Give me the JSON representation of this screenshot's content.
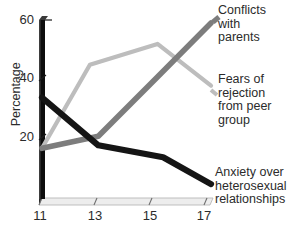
{
  "chart_data": {
    "type": "line",
    "title": "",
    "xlabel": "",
    "ylabel": "Percentage",
    "xlim": [
      11,
      17
    ],
    "ylim": [
      0,
      60
    ],
    "grid": false,
    "legend_position": "right-inline-annotations",
    "x_tick_labels": [
      "11",
      "13",
      "15",
      "17"
    ],
    "x_ticks": [
      11,
      13,
      15,
      17
    ],
    "y_tick_labels": [
      "20",
      "40",
      "60"
    ],
    "y_ticks": [
      20,
      40,
      60
    ],
    "series": [
      {
        "name": "Conflicts with parents",
        "color": "#7d7d7d",
        "x": [
          11,
          13,
          15,
          17
        ],
        "values": [
          17,
          21,
          40,
          59
        ]
      },
      {
        "name": "Fears of rejection from peer group",
        "color": "#bdbdbd",
        "x": [
          11,
          12.7,
          15.1,
          17
        ],
        "values": [
          17,
          45,
          52,
          38
        ]
      },
      {
        "name": "Anxiety over heterosexual relationships",
        "color": "#151515",
        "x": [
          11,
          13,
          15.3,
          17
        ],
        "values": [
          34,
          18,
          14,
          5
        ]
      }
    ]
  },
  "axes": {
    "y_title": "Percentage",
    "y_ticks": [
      {
        "label": "60",
        "value": 60
      },
      {
        "label": "40",
        "value": 40
      },
      {
        "label": "20",
        "value": 20
      }
    ],
    "x_ticks": [
      {
        "label": "11",
        "value": 11
      },
      {
        "label": "13",
        "value": 13
      },
      {
        "label": "15",
        "value": 15
      },
      {
        "label": "17",
        "value": 17
      }
    ]
  },
  "annotations": {
    "conflicts": "Conflicts\nwith\nparents",
    "fears": "Fears of\nrejection\nfrom peer\ngroup",
    "anxiety": "Anxiety over\nheterosexual\nrelationships"
  },
  "colors": {
    "conflicts_line": "#7d7d7d",
    "fears_line": "#bdbdbd",
    "anxiety_line": "#151515",
    "y_axis": "#0d0d0d",
    "x_axis_band_top": "#e9e9e9",
    "x_axis_band_side": "#c9c9c9",
    "text": "#2b2b2b",
    "background": "#ffffff"
  }
}
